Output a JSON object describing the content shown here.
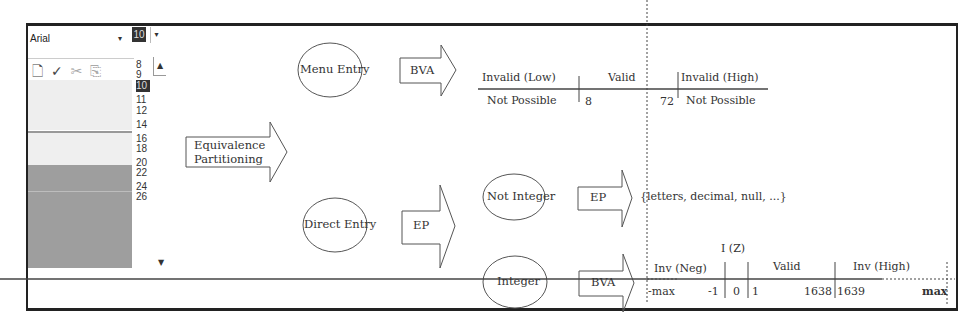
{
  "word_ui": {
    "font_name": "Arial",
    "font_size": "10",
    "toolbar_icons": [
      "print-preview-icon",
      "spelling-icon",
      "cut-icon",
      "copy-icon",
      "paste-icon"
    ],
    "size_options": [
      "8",
      "9",
      "10",
      "11",
      "12",
      "14",
      "16",
      "18",
      "20",
      "22",
      "24",
      "26"
    ],
    "selected_size": "10"
  },
  "diagram": {
    "root": {
      "label_line1": "Equivalence",
      "label_line2": "Partitioning"
    },
    "menu_entry": {
      "label": "Menu Entry",
      "technique": "BVA",
      "ranges": {
        "headers": [
          "Invalid (Low)",
          "Valid",
          "Invalid (High)"
        ],
        "values": [
          "Not Possible",
          "8",
          "72",
          "Not Possible"
        ]
      }
    },
    "direct_entry": {
      "label": "Direct Entry",
      "technique": "EP",
      "not_integer": {
        "label": "Not Integer",
        "technique": "EP",
        "result": "{letters, decimal, null, ...}"
      },
      "integer": {
        "label": "Integer",
        "technique": "BVA",
        "ranges": {
          "headers": [
            "Inv (Neg)",
            "I (Z)",
            "Valid",
            "Inv (High)"
          ],
          "values": [
            "-max",
            "-1",
            "0",
            "1",
            "1638",
            "1639",
            "max"
          ]
        }
      }
    }
  }
}
